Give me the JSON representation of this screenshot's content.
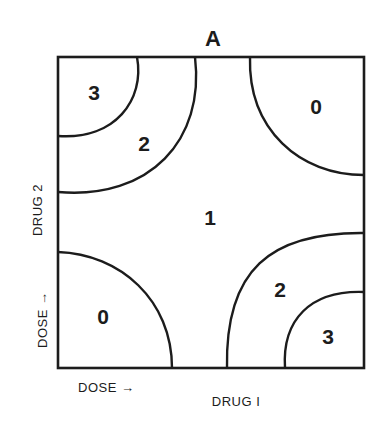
{
  "figure": {
    "panel_label": "A",
    "x_axis": {
      "dose_label": "DOSE →",
      "drug_label": "DRUG I"
    },
    "y_axis": {
      "dose_label": "DOSE →",
      "drug_label": "DRUG 2"
    },
    "regions": [
      {
        "id": "top-left-inner",
        "label": "3"
      },
      {
        "id": "top-left-outer",
        "label": "2"
      },
      {
        "id": "top-right",
        "label": "0"
      },
      {
        "id": "center",
        "label": "1"
      },
      {
        "id": "bottom-left",
        "label": "0"
      },
      {
        "id": "bottom-right-outer",
        "label": "2"
      },
      {
        "id": "bottom-right-inner",
        "label": "3"
      }
    ],
    "line_color": "#1c1c1c"
  }
}
